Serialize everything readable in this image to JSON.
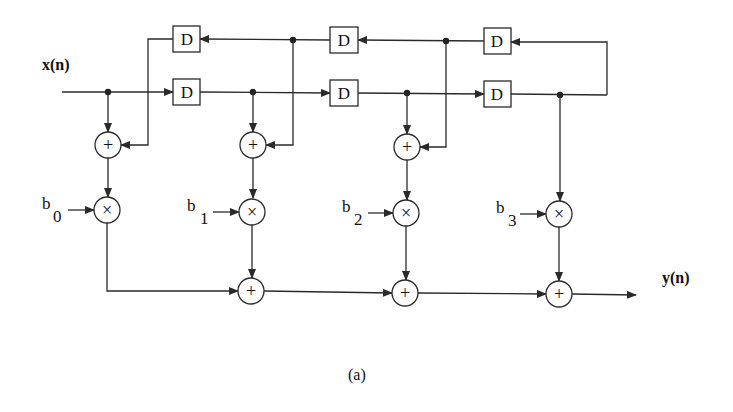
{
  "diagram": {
    "input_label": "x(n)",
    "output_label": "y(n)",
    "caption": "(a)",
    "delay_label": "D",
    "colors": {
      "ink": "#2a2a2a",
      "background": "#ffffff"
    },
    "delays_top": [
      {
        "label": "D",
        "cx": 187,
        "cy": 39
      },
      {
        "label": "D",
        "cx": 344,
        "cy": 40
      },
      {
        "label": "D",
        "cx": 497,
        "cy": 41
      }
    ],
    "delays_bottom": [
      {
        "label": "D",
        "cx": 187,
        "cy": 92
      },
      {
        "label": "D",
        "cx": 344,
        "cy": 93
      },
      {
        "label": "D",
        "cx": 497,
        "cy": 94
      }
    ],
    "coefficients": [
      {
        "base": "b",
        "sub": "0"
      },
      {
        "base": "b",
        "sub": "1"
      },
      {
        "base": "b",
        "sub": "2"
      },
      {
        "base": "b",
        "sub": "3"
      }
    ],
    "taps": [
      {
        "x": 108,
        "pre_adder": true,
        "multiplier": "×",
        "output_adder": false
      },
      {
        "x": 253,
        "pre_adder": true,
        "multiplier": "×",
        "output_adder": true
      },
      {
        "x": 407,
        "pre_adder": true,
        "multiplier": "×",
        "output_adder": true
      },
      {
        "x": 560,
        "pre_adder": false,
        "multiplier": "×",
        "output_adder": true
      }
    ],
    "adder_symbol": "+",
    "multiplier_symbol": "×"
  }
}
